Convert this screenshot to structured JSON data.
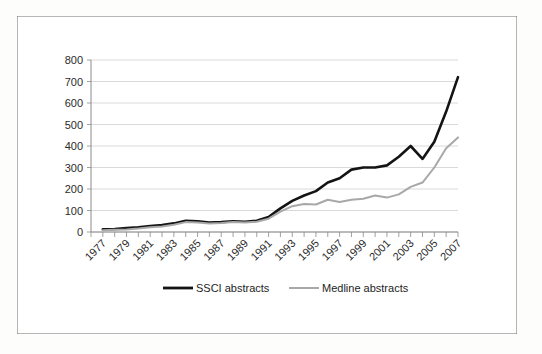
{
  "figure": {
    "background_color": "#ffffff",
    "frame_color": "#3a3a3a"
  },
  "chart_data": {
    "type": "line",
    "title": "",
    "subtitle": "",
    "xlabel": "",
    "ylabel": "",
    "grid": true,
    "legend_position": "bottom",
    "ylim": [
      0,
      800
    ],
    "ytick_step": 100,
    "yticks": [
      0,
      100,
      200,
      300,
      400,
      500,
      600,
      700,
      800
    ],
    "xlim": [
      1976,
      2007
    ],
    "xtick_step": 2,
    "x": [
      1977,
      1978,
      1979,
      1980,
      1981,
      1982,
      1983,
      1984,
      1985,
      1986,
      1987,
      1988,
      1989,
      1990,
      1991,
      1992,
      1993,
      1994,
      1995,
      1996,
      1997,
      1998,
      1999,
      2000,
      2001,
      2002,
      2003,
      2004,
      2005,
      2006,
      2007
    ],
    "xtick_labels": [
      "1977",
      "1979",
      "1981",
      "1983",
      "1985",
      "1987",
      "1989",
      "1991",
      "1993",
      "1995",
      "1997",
      "1999",
      "2001",
      "2003",
      "2005",
      "2007"
    ],
    "colors": {
      "ssci": "#141414",
      "medline": "#a8a8a8",
      "gridline": "#c9c9c9",
      "axis": "#8a8a8a"
    },
    "series": [
      {
        "name": "SSCI abstracts",
        "color": "#141414",
        "values": [
          12,
          14,
          18,
          22,
          28,
          32,
          40,
          52,
          50,
          44,
          46,
          50,
          48,
          52,
          70,
          110,
          145,
          170,
          190,
          230,
          250,
          290,
          300,
          300,
          310,
          350,
          400,
          340,
          420,
          560,
          720
        ]
      },
      {
        "name": "Medline abstracts",
        "color": "#a8a8a8",
        "values": [
          8,
          10,
          12,
          16,
          22,
          26,
          34,
          46,
          44,
          40,
          42,
          46,
          44,
          48,
          62,
          95,
          120,
          130,
          128,
          150,
          140,
          150,
          155,
          170,
          160,
          175,
          210,
          230,
          300,
          390,
          440
        ]
      }
    ],
    "legend": [
      {
        "label": "SSCI abstracts",
        "color": "#141414",
        "style": "thick-solid"
      },
      {
        "label": "Medline abstracts",
        "color": "#a8a8a8",
        "style": "thin-solid"
      }
    ]
  }
}
